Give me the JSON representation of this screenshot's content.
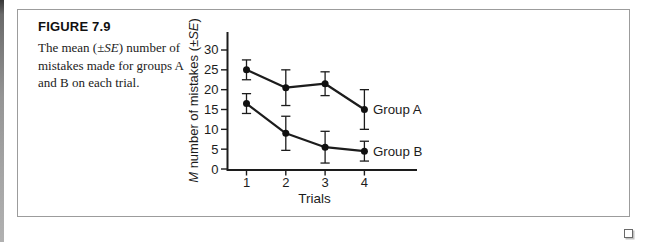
{
  "figure": {
    "label": "FIGURE 7.9",
    "caption_text": "The mean (±SE) number of mistakes made for groups A and B on each trial.",
    "caption_lines": [
      [
        {
          "t": "The mean (±",
          "i": false
        },
        {
          "t": "SE",
          "i": true
        },
        {
          "t": ") number of",
          "i": false
        }
      ],
      [
        {
          "t": "mistakes made for groups A",
          "i": false
        }
      ],
      [
        {
          "t": "and B on each trial.",
          "i": false
        }
      ]
    ],
    "end_marker_symbol": "open-square"
  },
  "chart_data": {
    "type": "line",
    "title": "",
    "x": [
      1,
      2,
      3,
      4
    ],
    "xlabel": "Trials",
    "ylabel": "M number of mistakes (±SE)",
    "ylabel_parts": [
      {
        "t": "M",
        "i": true
      },
      {
        "t": " number of mistakes (±",
        "i": false
      },
      {
        "t": "SE",
        "i": true
      },
      {
        "t": ")",
        "i": false
      }
    ],
    "yticks": [
      0,
      5,
      10,
      15,
      20,
      25,
      30
    ],
    "ylim": [
      0,
      33
    ],
    "xlim": [
      0.5,
      5.3
    ],
    "grid": false,
    "legend": "labels-at-line-end",
    "error_bars": true,
    "series": [
      {
        "name": "Group A",
        "values": [
          25,
          20.5,
          21.5,
          15
        ],
        "se": [
          2.5,
          4.5,
          3,
          5
        ]
      },
      {
        "name": "Group B",
        "values": [
          16.5,
          9,
          5.5,
          4.5
        ],
        "se": [
          2.5,
          4.3,
          4,
          2.5
        ]
      }
    ]
  },
  "colors": {
    "ink": "#1c1c1c",
    "frame_border": "#9c9c9c",
    "caption_text": "#1b1b1b"
  }
}
